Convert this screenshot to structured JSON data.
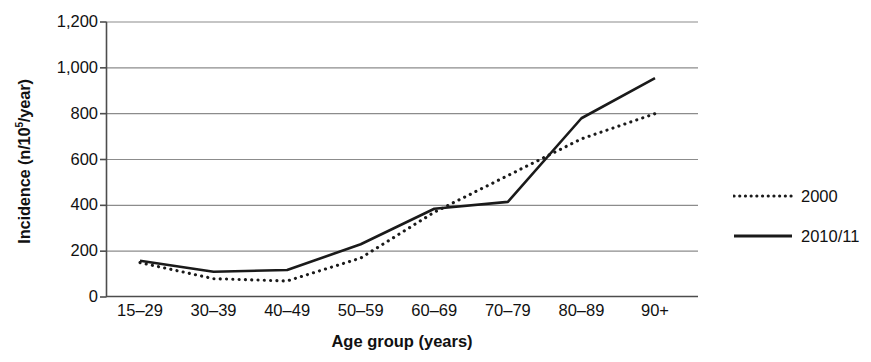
{
  "chart_data": {
    "type": "line",
    "title": "",
    "xlabel": "Age group (years)",
    "ylabel": "Incidence (n/10",
    "ylabel_sup": "5",
    "ylabel_tail": "/year)",
    "categories": [
      "15–29",
      "30–39",
      "40–49",
      "50–59",
      "60–69",
      "70–79",
      "80–89",
      "90+"
    ],
    "series": [
      {
        "name": "2000",
        "style": "dotted",
        "color": "#1a1a1a",
        "values": [
          150,
          80,
          70,
          170,
          370,
          530,
          690,
          800
        ]
      },
      {
        "name": "2010/11",
        "style": "solid",
        "color": "#1a1a1a",
        "values": [
          158,
          110,
          118,
          230,
          385,
          415,
          780,
          955
        ]
      }
    ],
    "ylim": [
      0,
      1200
    ],
    "yticks": [
      0,
      200,
      400,
      600,
      800,
      1000,
      1200
    ],
    "ytick_labels": [
      "0",
      "200",
      "400",
      "600",
      "800",
      "1,000",
      "1,200"
    ],
    "grid": true,
    "grid_color": "#8c8c8c",
    "axis_color": "#4d4d4d",
    "legend_position": "right",
    "legend": [
      {
        "label": "2000",
        "style": "dotted"
      },
      {
        "label": "2010/11",
        "style": "solid"
      }
    ]
  }
}
